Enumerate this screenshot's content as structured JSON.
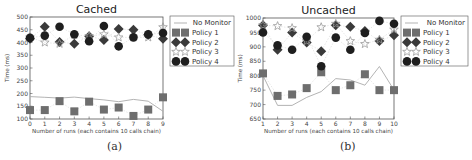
{
  "colors": {
    "no_monitor": "#aaaaaa",
    "policy1": "#6e6e6e",
    "policy2": "#3a3a3a",
    "policy3": "#9a9a9a",
    "policy4": "#1e1e1e",
    "axis": "#555555",
    "text": "#444444"
  },
  "legend": [
    "No Monitor",
    "Policy 1",
    "Policy 2",
    "Policy 3",
    "Policy 4"
  ],
  "chart_data": [
    {
      "type": "scatter",
      "title": "Cached",
      "caption": "(a)",
      "xlabel": "Number of runs (each contains 10 calls chain)",
      "ylabel": "Time (ms)",
      "x": [
        0,
        1,
        2,
        3,
        4,
        5,
        6,
        7,
        8,
        9
      ],
      "xticks": [
        "0",
        "1",
        "2",
        "3",
        "4",
        "5",
        "6",
        "7",
        "8",
        "9"
      ],
      "ylim": [
        100,
        500
      ],
      "yticks": [
        100,
        150,
        200,
        250,
        300,
        350,
        400,
        450,
        500
      ],
      "grid": false,
      "legend_position": "outside right",
      "series": [
        {
          "name": "No Monitor",
          "style": "line",
          "values": [
            188,
            185,
            182,
            186,
            180,
            175,
            168,
            177,
            170,
            130
          ]
        },
        {
          "name": "Policy 1",
          "style": "square",
          "values": [
            135,
            135,
            170,
            130,
            168,
            137,
            145,
            112,
            137,
            185
          ]
        },
        {
          "name": "Policy 2",
          "style": "diamond",
          "values": [
            415,
            462,
            402,
            395,
            425,
            410,
            453,
            450,
            430,
            415
          ]
        },
        {
          "name": "Policy 3",
          "style": "star",
          "values": [
            420,
            400,
            395,
            430,
            425,
            432,
            420,
            420,
            420,
            460
          ]
        },
        {
          "name": "Policy 4",
          "style": "circle",
          "values": [
            418,
            427,
            462,
            432,
            405,
            465,
            385,
            420,
            432,
            437
          ]
        }
      ]
    },
    {
      "type": "scatter",
      "title": "Uncached",
      "caption": "(b)",
      "xlabel": "Number of runs (each contains 10 calls chain)",
      "ylabel": "Time (ms)",
      "x": [
        1,
        2,
        3,
        4,
        5,
        6,
        7,
        8,
        9,
        10
      ],
      "xticks": [
        "1",
        "2",
        "3",
        "4",
        "5",
        "6",
        "7",
        "8",
        "9",
        "10"
      ],
      "ylim": [
        650,
        1000
      ],
      "yticks": [
        650,
        700,
        750,
        800,
        850,
        900,
        950,
        1000
      ],
      "grid": false,
      "legend_position": "outside right",
      "series": [
        {
          "name": "No Monitor",
          "style": "line",
          "values": [
            800,
            697,
            697,
            725,
            745,
            790,
            785,
            767,
            832,
            750
          ]
        },
        {
          "name": "Policy 1",
          "style": "square",
          "values": [
            808,
            730,
            735,
            757,
            812,
            750,
            767,
            805,
            750,
            750
          ]
        },
        {
          "name": "Policy 2",
          "style": "diamond",
          "values": [
            975,
            890,
            950,
            915,
            885,
            975,
            970,
            955,
            920,
            940
          ]
        },
        {
          "name": "Policy 3",
          "style": "star",
          "values": [
            975,
            972,
            965,
            920,
            968,
            980,
            920,
            910,
            925,
            960
          ]
        },
        {
          "name": "Policy 4",
          "style": "circle",
          "values": [
            950,
            905,
            890,
            935,
            833,
            932,
            890,
            948,
            990,
            980
          ]
        }
      ]
    }
  ]
}
